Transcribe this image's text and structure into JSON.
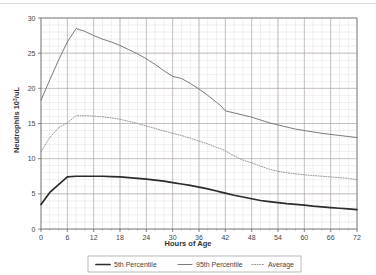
{
  "chart_data": {
    "type": "line",
    "title": "",
    "xlabel": "Hours of Age",
    "ylabel": "Neutrophils 10",
    "ylabel_sup": "3",
    "ylabel_tail": "/uL",
    "xlim": [
      0,
      72
    ],
    "ylim": [
      0,
      30
    ],
    "xticks": [
      0,
      6,
      12,
      18,
      24,
      30,
      36,
      42,
      48,
      54,
      60,
      66,
      72
    ],
    "yticks": [
      0,
      5,
      10,
      15,
      20,
      25,
      30
    ],
    "xtick_labels": [
      "0",
      "6",
      "12",
      "18",
      "24",
      "30",
      "36",
      "42",
      "48",
      "54",
      "60",
      "66",
      "72"
    ],
    "ytick_labels": [
      "0",
      "5",
      "10",
      "15",
      "20",
      "25",
      "30"
    ],
    "x_minor_step": 2,
    "y_minor_step": 1,
    "grid": true,
    "grid_color": "#c9bfbf",
    "legend_position": "below",
    "x": [
      0,
      2,
      4,
      6,
      8,
      10,
      12,
      14,
      16,
      18,
      20,
      22,
      24,
      26,
      28,
      30,
      32,
      34,
      36,
      38,
      40,
      41,
      42,
      44,
      46,
      48,
      50,
      52,
      54,
      56,
      58,
      60,
      62,
      64,
      66,
      68,
      70,
      72
    ],
    "series": [
      {
        "name": "5th Percentile",
        "style": "solid-thick",
        "color": "#2b2b2b",
        "values": [
          3.5,
          5.2,
          6.3,
          7.4,
          7.5,
          7.5,
          7.5,
          7.5,
          7.45,
          7.4,
          7.3,
          7.2,
          7.1,
          6.95,
          6.8,
          6.6,
          6.4,
          6.2,
          5.95,
          5.7,
          5.4,
          5.25,
          5.1,
          4.8,
          4.55,
          4.3,
          4.05,
          3.9,
          3.75,
          3.6,
          3.5,
          3.4,
          3.25,
          3.15,
          3.05,
          2.95,
          2.85,
          2.75
        ]
      },
      {
        "name": "95th Percentile",
        "style": "solid-thin",
        "color": "#6b6b6b",
        "values": [
          18.3,
          21.2,
          24.0,
          26.6,
          28.5,
          28.1,
          27.5,
          27.0,
          26.6,
          26.1,
          25.5,
          24.9,
          24.2,
          23.4,
          22.5,
          21.7,
          21.4,
          20.7,
          19.9,
          19.0,
          18.0,
          17.5,
          16.8,
          16.5,
          16.2,
          15.9,
          15.5,
          15.1,
          14.8,
          14.5,
          14.2,
          14.0,
          13.8,
          13.6,
          13.45,
          13.3,
          13.15,
          13.0
        ]
      },
      {
        "name": "Average",
        "style": "dotted",
        "color": "#8a8a8a",
        "values": [
          11.0,
          13.0,
          14.4,
          15.1,
          16.1,
          16.1,
          16.05,
          15.95,
          15.8,
          15.6,
          15.3,
          15.0,
          14.65,
          14.3,
          13.95,
          13.6,
          13.3,
          12.9,
          12.5,
          12.1,
          11.6,
          11.4,
          11.1,
          10.4,
          9.8,
          9.4,
          8.95,
          8.5,
          8.2,
          8.0,
          7.85,
          7.7,
          7.6,
          7.5,
          7.4,
          7.3,
          7.2,
          7.0
        ]
      }
    ],
    "legend": [
      {
        "label": "5th Percentile",
        "style": "solid-thick",
        "color": "#2b2b2b"
      },
      {
        "label": "95th Percentile",
        "style": "solid-thin",
        "color": "#6b6b6b"
      },
      {
        "label": "Average",
        "style": "dotted",
        "color": "#8a8a8a"
      }
    ]
  }
}
